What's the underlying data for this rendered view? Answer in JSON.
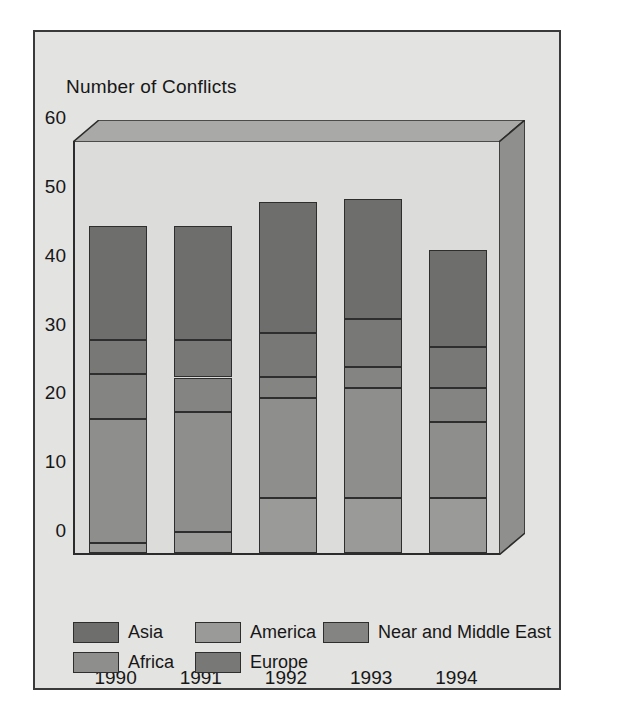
{
  "figure": {
    "axis_title": "Number of Conflicts",
    "background": "#e3e3e1",
    "border_color": "#3a3a3a",
    "plot_face": "#dcdcda",
    "wall_top_color": "#a9a9a7",
    "wall_right_color": "#8f8f8d"
  },
  "chart_data": {
    "type": "bar",
    "stacked": true,
    "title": "Number of Conflicts",
    "xlabel": "",
    "ylabel": "Number of Conflicts",
    "ylim": [
      0,
      60
    ],
    "yticks": [
      0,
      10,
      20,
      30,
      40,
      50,
      60
    ],
    "grid": false,
    "legend_position": "bottom",
    "categories": [
      "1990",
      "1991",
      "1992",
      "1993",
      "1994"
    ],
    "series": [
      {
        "name": "Africa",
        "color": "#8e8e8c",
        "values": [
          17.5,
          17.5,
          14.5,
          16.0,
          11.0
        ]
      },
      {
        "name": "America",
        "color": "#9a9a98",
        "values": [
          1.5,
          3.0,
          8.0,
          8.0,
          8.0
        ]
      },
      {
        "name": "Asia",
        "color": "#6e6e6c",
        "values": [
          16.5,
          16.5,
          19.0,
          17.5,
          14.0
        ]
      },
      {
        "name": "Europe",
        "color": "#787876",
        "values": [
          5.0,
          5.5,
          6.5,
          7.0,
          6.0
        ]
      },
      {
        "name": "Near and Middle East",
        "color": "#848482",
        "values": [
          6.5,
          5.0,
          3.0,
          3.0,
          5.0
        ]
      }
    ],
    "stack_order_bottom_to_top": [
      "America",
      "Africa",
      "Near and Middle East",
      "Europe",
      "Asia"
    ],
    "totals": [
      47.5,
      47.5,
      51.0,
      51.5,
      44.0
    ],
    "stack_boundaries": {
      "1990": [
        0,
        1.5,
        19.5,
        26.0,
        31.0,
        47.5
      ],
      "1991": [
        0,
        3.0,
        20.5,
        25.5,
        31.0,
        47.5
      ],
      "1992": [
        0,
        8.0,
        22.5,
        25.5,
        32.0,
        51.0
      ],
      "1993": [
        0,
        8.0,
        24.0,
        27.0,
        34.0,
        51.5
      ],
      "1994": [
        0,
        8.0,
        19.0,
        24.0,
        30.0,
        44.0
      ]
    }
  },
  "legend": {
    "rows": [
      [
        {
          "label": "Asia",
          "color": "#6e6e6c"
        },
        {
          "label": "America",
          "color": "#9a9a98"
        },
        {
          "label": "Near and Middle East",
          "color": "#848482"
        }
      ],
      [
        {
          "label": "Africa",
          "color": "#8e8e8c"
        },
        {
          "label": "Europe",
          "color": "#787876"
        }
      ]
    ]
  }
}
